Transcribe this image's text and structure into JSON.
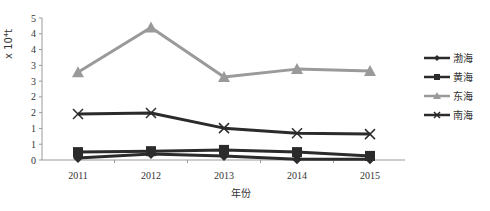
{
  "chart_data": {
    "type": "line",
    "title": "",
    "xlabel": "年份",
    "ylabel": "x 10⁴t",
    "categories": [
      "2011",
      "2012",
      "2013",
      "2014",
      "2015"
    ],
    "ylim": [
      0,
      4.5
    ],
    "y_ticks": [
      0,
      0.5,
      1,
      1.5,
      2,
      2.5,
      3,
      3.5,
      4,
      4.5
    ],
    "y_tick_labels": [
      "0",
      "1",
      "1",
      "2",
      "2",
      "3",
      "3",
      "4",
      "4",
      "5"
    ],
    "grid": false,
    "legend_position": "right",
    "series": [
      {
        "name": "渤海",
        "marker": "diamond",
        "color": "#2b2b2b",
        "values": [
          0.06,
          0.19,
          0.13,
          0.02,
          0.02
        ]
      },
      {
        "name": "黄海",
        "marker": "square",
        "color": "#2b2b2b",
        "values": [
          0.25,
          0.28,
          0.32,
          0.25,
          0.13
        ]
      },
      {
        "name": "东海",
        "marker": "triangle",
        "color": "#9a9a9a",
        "values": [
          2.78,
          4.2,
          2.63,
          2.88,
          2.82
        ]
      },
      {
        "name": "南海",
        "marker": "x",
        "color": "#2b2b2b",
        "values": [
          1.46,
          1.49,
          1.01,
          0.85,
          0.82
        ]
      }
    ]
  }
}
